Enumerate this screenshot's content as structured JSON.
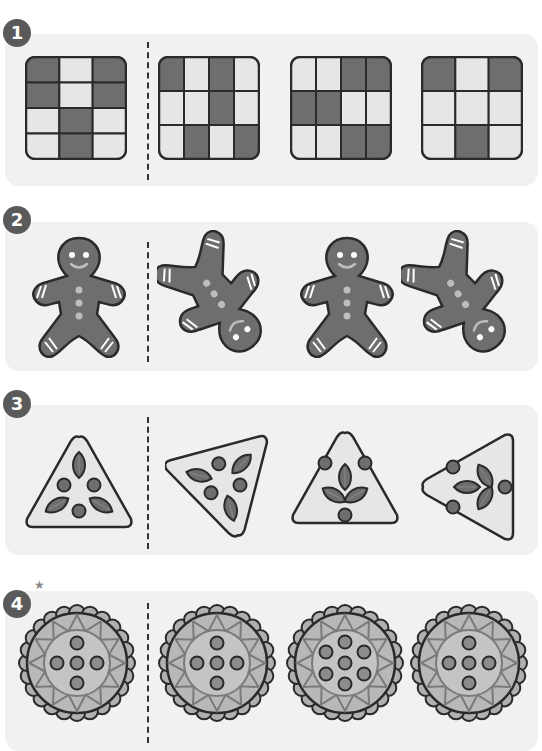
{
  "colors": {
    "panel_bg": "#f1f1f1",
    "badge_bg": "#5a5a5a",
    "dark": "#6e6e6e",
    "light": "#e6e6e6",
    "outline": "#2a2a2a",
    "accent_light": "#bdbdbd",
    "star": "#8a8a8a"
  },
  "top_text": "· · · · · · ·",
  "sections": [
    {
      "number": "1",
      "type": "grid",
      "items": [
        {
          "cols": 3,
          "rows": [
            [
              1,
              0,
              1
            ],
            [
              1,
              0,
              1
            ],
            [
              0,
              1,
              0
            ],
            [
              0,
              1,
              0
            ]
          ]
        },
        {
          "cols": 4,
          "rows": [
            [
              1,
              0,
              1,
              0
            ],
            [
              0,
              0,
              1,
              0
            ],
            [
              0,
              1,
              0,
              1
            ]
          ]
        },
        {
          "cols": 4,
          "rows": [
            [
              0,
              0,
              1,
              1
            ],
            [
              1,
              1,
              0,
              0
            ],
            [
              0,
              0,
              1,
              1
            ]
          ]
        },
        {
          "cols": 3,
          "rows": [
            [
              1,
              0,
              1
            ],
            [
              0,
              0,
              0
            ],
            [
              0,
              1,
              0
            ]
          ]
        }
      ]
    },
    {
      "number": "2",
      "type": "gingerbread",
      "items": [
        {
          "rotate": 0,
          "mirror": false
        },
        {
          "rotate": 145,
          "mirror": false
        },
        {
          "rotate": 0,
          "mirror": false
        },
        {
          "rotate": 145,
          "mirror": true
        }
      ]
    },
    {
      "number": "3",
      "type": "triangle",
      "items": [
        {
          "rotate": 0,
          "variant": "a"
        },
        {
          "rotate": 165,
          "variant": "a"
        },
        {
          "rotate": 180,
          "variant": "b"
        },
        {
          "rotate": 90,
          "variant": "b"
        }
      ]
    },
    {
      "number": "4",
      "star": "★",
      "type": "cookie",
      "items": [
        {
          "dots": "plus"
        },
        {
          "dots": "plus"
        },
        {
          "dots": "hex"
        },
        {
          "dots": "plus"
        }
      ]
    }
  ]
}
